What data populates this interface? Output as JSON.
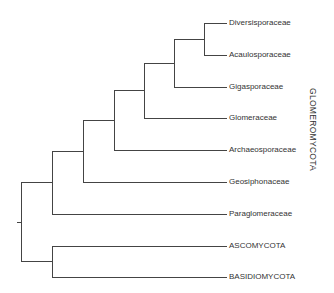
{
  "diagram": {
    "type": "phylogenetic-tree (cladogram)",
    "line_color": "#444444",
    "leaves": [
      {
        "id": "diversisporaceae",
        "label": "Diversisporaceae",
        "y": 23
      },
      {
        "id": "acaulosporaceae",
        "label": "Acaulosporaceae",
        "y": 55
      },
      {
        "id": "gigasporaceae",
        "label": "Gigasporaceae",
        "y": 87
      },
      {
        "id": "glomeraceae",
        "label": "Glomeraceae",
        "y": 118
      },
      {
        "id": "archaeosporaceae",
        "label": "Archaeosporaceae",
        "y": 150
      },
      {
        "id": "geosiphonaceae",
        "label": "Geosiphonaceae",
        "y": 182
      },
      {
        "id": "paraglomeraceae",
        "label": "Paraglomeraceae",
        "y": 214
      },
      {
        "id": "ascomycota",
        "label": "ASCOMYCOTA",
        "y": 246
      },
      {
        "id": "basidiomycota",
        "label": "BASIDIOMYCOTA",
        "y": 277
      }
    ],
    "group_label": "GLOMEROMYCOTA",
    "topology": "((((((((Diversisporaceae,Acaulosporaceae),Gigasporaceae),Glomeraceae),Archaeosporaceae),Geosiphonaceae),Paraglomeraceae),(ASCOMYCOTA,BASIDIOMYCOTA)))"
  }
}
